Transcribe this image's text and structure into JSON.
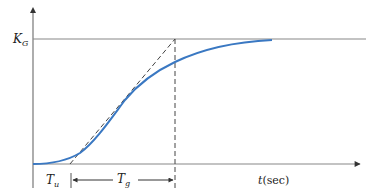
{
  "diagram": {
    "type": "step-response",
    "y_level_label": {
      "main": "K",
      "sub": "G"
    },
    "x_axis_label": {
      "var": "t",
      "unit": "(sec)"
    },
    "interval_labels": [
      {
        "main": "T",
        "sub": "u"
      },
      {
        "main": "T",
        "sub": "g"
      }
    ],
    "colors": {
      "curve": "#3a78c2",
      "axes": "#777777",
      "dashed": "#444444"
    }
  }
}
